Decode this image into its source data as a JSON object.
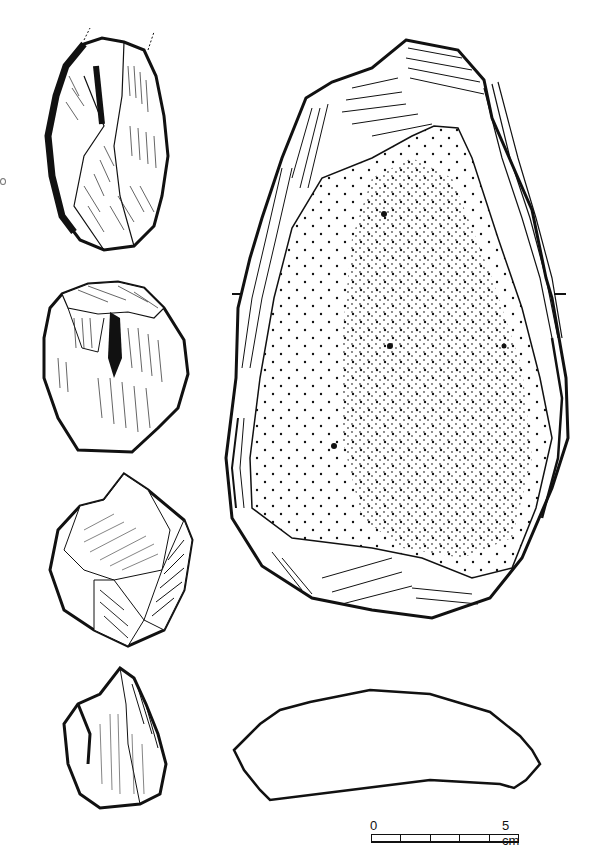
{
  "figure": {
    "type": "archaeological lithic illustration",
    "artifacts": [
      {
        "id": "flake-1",
        "label": "elongated flake tool (dorsal view)",
        "position": "left column, top"
      },
      {
        "id": "core-2",
        "label": "flake/core fragment",
        "position": "left column, second"
      },
      {
        "id": "core-3",
        "label": "polyhedral core",
        "position": "left column, third"
      },
      {
        "id": "flake-4",
        "label": "small flake fragment",
        "position": "left column, bottom"
      },
      {
        "id": "large-tool",
        "label": "large cortical flake tool with stippled cortex",
        "position": "right, top"
      },
      {
        "id": "cross-section",
        "label": "cross-section of large tool",
        "position": "right, bottom"
      }
    ],
    "section_markers": [
      "-",
      "-"
    ]
  },
  "scale": {
    "start_label": "0",
    "end_label": "5 cm",
    "divisions": 5
  },
  "colors": {
    "ink": "#111111",
    "paper": "#ffffff"
  }
}
